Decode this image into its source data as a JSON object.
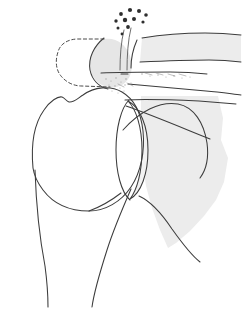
{
  "figure": {
    "caption": "",
    "width": 242,
    "height": 315,
    "background_color": "#ffffff"
  },
  "palette": {
    "outline": "#3c3c3c",
    "outline_light": "#555555",
    "shade_fill": "#ececec",
    "shade_fill_light": "#f2f2f2",
    "shade_fill_mid": "#e6e6e6",
    "dot_fill": "#2e2e2e",
    "stipple_fill": "#6e6e6e",
    "dashed_stroke": "#4a4a4a",
    "page_white": "#ffffff"
  },
  "structures": [
    {
      "id": "humeral-head",
      "label": "Humeral head",
      "kind": "outline",
      "fill": "#ffffff",
      "path": "M 33 168 C 31 146 34 124 44 110 C 50 101 58 96 62 97 C 65 98 66 101 69 102 C 73 103 77 99 83 95 C 94 87 110 85 122 92 C 134 99 141 113 143 131 C 145 151 141 172 131 187 C 121 202 105 211 89 211 C 66 211 52 202 43 190 C 37 182 34 175 33 168 Z"
    },
    {
      "id": "humeral-shaft-medial",
      "label": "Humeral shaft medial border",
      "kind": "line",
      "path": "M 35 170 C 36 200 40 240 45 266 C 47 281 48 295 48 307"
    },
    {
      "id": "humeral-shaft-lateral",
      "label": "Humeral shaft lateral border",
      "kind": "line",
      "path": "M 131 189 C 124 205 114 228 107 250 C 100 272 94 292 92 307"
    },
    {
      "id": "humeral-neck",
      "label": "Surgical neck of humerus",
      "kind": "line",
      "path": "M 89 211 C 100 207 112 200 121 193"
    },
    {
      "id": "glenoid-rim",
      "label": "Glenoid rim",
      "kind": "outline",
      "fill": "#f2f2f2",
      "path": "M 128 101 C 140 107 148 126 148 150 C 148 174 141 193 130 199 C 137 190 142 172 142 150 C 142 127 136 109 128 101 Z"
    },
    {
      "id": "glenoid-fossa-line",
      "label": "Glenoid fossa line",
      "kind": "line",
      "path": "M 129 100 C 121 108 116 128 116 150 C 116 172 121 192 130 200"
    },
    {
      "id": "scapula-body",
      "label": "Scapula body",
      "kind": "shape",
      "fill": "#ececec",
      "path": "M 141 96 L 218 96 L 223 118 L 221 140 L 228 158 L 224 182 L 216 200 L 204 216 L 190 231 L 176 243 L 168 248 L 160 230 L 152 208 L 146 186 L 142 160 L 141 130 Z"
    },
    {
      "id": "scapula-lateral-border",
      "label": "Scapula lateral border",
      "kind": "line",
      "path": "M 139 196 C 150 201 162 214 172 229 C 182 243 191 255 200 262"
    },
    {
      "id": "scapula-spine-upper",
      "label": "Scapular spine upper line",
      "kind": "line",
      "path": "M 125 100 C 146 99 176 100 199 101 C 213 102 225 103 236 104"
    },
    {
      "id": "scapula-spine-lower",
      "label": "Scapular spine lower line",
      "kind": "line",
      "path": "M 128 84 C 152 86 182 89 206 91 C 220 92 232 94 241 95"
    },
    {
      "id": "coracoid-arc",
      "label": "Coracoid / supraspinatus arc",
      "kind": "line",
      "path": "M 123 130 C 140 111 160 101 178 104 C 194 107 204 123 207 143 C 209 158 206 170 200 178"
    },
    {
      "id": "subscapular-line",
      "label": "Subscapular oblique line",
      "kind": "line",
      "path": "M 126 106 C 152 115 185 129 210 139"
    },
    {
      "id": "acromion-body",
      "label": "Acromion process",
      "kind": "shape",
      "fill": "#e6e6e6",
      "path": "M 104 39 C 116 37 126 44 130 56 C 134 68 131 80 122 85 C 113 90 100 87 94 78 C 87 68 89 48 104 39 Z"
    },
    {
      "id": "acromion-anterior-edge",
      "label": "Acromion anterior edge",
      "kind": "line",
      "path": "M 104 38 C 94 46 88 58 90 70 C 92 80 99 87 108 89"
    },
    {
      "id": "acromion-undersurface",
      "label": "Acromion undersurface line",
      "kind": "line",
      "path": "M 101 73 C 121 72 148 72 170 72 C 186 72 198 73 207 74"
    },
    {
      "id": "acromion-resection-outline",
      "label": "Resected acromion dashed outline",
      "kind": "dashed",
      "path": "M 104 39 L 78 39 C 68 39 60 44 58 52 C 55 61 56 70 61 76 C 66 82 73 86 82 86 L 110 87"
    },
    {
      "id": "clavicle-upper",
      "label": "Clavicle upper border",
      "kind": "line",
      "path": "M 142 38 C 160 35 185 33 205 33 C 220 33 232 34 241 35"
    },
    {
      "id": "clavicle-lower",
      "label": "Clavicle lower border",
      "kind": "line",
      "path": "M 140 62 C 162 61 188 60 209 60 C 223 60 233 61 241 62"
    },
    {
      "id": "clavicle-body",
      "label": "Clavicle body",
      "kind": "shape",
      "fill": "#ececec",
      "path": "M 142 38 C 160 35 185 33 205 33 L 241 35 L 241 62 L 209 60 C 188 60 162 61 140 62 Z"
    },
    {
      "id": "acromioclavicular-gap",
      "label": "Acromioclavicular joint gap",
      "kind": "line",
      "path": "M 137 40 C 133 49 131 59 131 68"
    },
    {
      "id": "coracoacromial-stem",
      "label": "Coracoacromial stem",
      "kind": "line",
      "path": "M 131 28 C 128 40 127 56 127 70"
    },
    {
      "id": "coracoacromial-stem-2",
      "label": "Coracoacromial stem medial",
      "kind": "line",
      "path": "M 124 30 C 121 42 120 56 120 70"
    },
    {
      "id": "deltoid-attachment",
      "label": "Deltoid attachment marker",
      "kind": "line",
      "path": "M 121 74 L 128 74"
    }
  ],
  "dot_cluster": {
    "label": "Calcific deposits cluster",
    "fill": "#2e2e2e",
    "dots": [
      {
        "cx": 121,
        "cy": 14,
        "r": 1.9
      },
      {
        "cx": 130,
        "cy": 10,
        "r": 2.1
      },
      {
        "cx": 139,
        "cy": 11,
        "r": 2.0
      },
      {
        "cx": 146,
        "cy": 15,
        "r": 1.8
      },
      {
        "cx": 116,
        "cy": 21,
        "r": 1.7
      },
      {
        "cx": 125,
        "cy": 20,
        "r": 2.2
      },
      {
        "cx": 134,
        "cy": 19,
        "r": 2.0
      },
      {
        "cx": 143,
        "cy": 22,
        "r": 1.6
      },
      {
        "cx": 118,
        "cy": 28,
        "r": 1.5
      },
      {
        "cx": 128,
        "cy": 27,
        "r": 1.9
      },
      {
        "cx": 122,
        "cy": 34,
        "r": 1.4
      }
    ]
  },
  "stipple_field": {
    "label": "Bone texture stipple under acromion",
    "fill": "#6e6e6e",
    "dots": [
      {
        "cx": 106,
        "cy": 79,
        "r": 0.7
      },
      {
        "cx": 111,
        "cy": 81,
        "r": 0.6
      },
      {
        "cx": 116,
        "cy": 78,
        "r": 0.7
      },
      {
        "cx": 121,
        "cy": 82,
        "r": 0.6
      },
      {
        "cx": 126,
        "cy": 79,
        "r": 0.8
      },
      {
        "cx": 109,
        "cy": 85,
        "r": 0.6
      },
      {
        "cx": 115,
        "cy": 86,
        "r": 0.7
      },
      {
        "cx": 120,
        "cy": 88,
        "r": 0.6
      },
      {
        "cx": 125,
        "cy": 85,
        "r": 0.7
      },
      {
        "cx": 131,
        "cy": 83,
        "r": 0.6
      },
      {
        "cx": 112,
        "cy": 91,
        "r": 0.6
      },
      {
        "cx": 118,
        "cy": 93,
        "r": 0.5
      },
      {
        "cx": 124,
        "cy": 91,
        "r": 0.6
      },
      {
        "cx": 142,
        "cy": 74,
        "r": 0.8
      },
      {
        "cx": 150,
        "cy": 76,
        "r": 0.6
      },
      {
        "cx": 158,
        "cy": 75,
        "r": 0.7
      },
      {
        "cx": 166,
        "cy": 77,
        "r": 0.6
      },
      {
        "cx": 174,
        "cy": 76,
        "r": 0.7
      },
      {
        "cx": 182,
        "cy": 78,
        "r": 0.6
      },
      {
        "cx": 190,
        "cy": 77,
        "r": 0.6
      }
    ]
  },
  "hatch_marks": {
    "label": "Fine hatching on acromion undersurface",
    "stroke": "#8a8a8a",
    "lines": [
      {
        "x1": 145,
        "y1": 73,
        "x2": 152,
        "y2": 75
      },
      {
        "x1": 156,
        "y1": 73,
        "x2": 163,
        "y2": 75
      },
      {
        "x1": 168,
        "y1": 74,
        "x2": 175,
        "y2": 76
      },
      {
        "x1": 179,
        "y1": 74,
        "x2": 186,
        "y2": 76
      },
      {
        "x1": 118,
        "y1": 84,
        "x2": 124,
        "y2": 87
      },
      {
        "x1": 127,
        "y1": 83,
        "x2": 133,
        "y2": 86
      }
    ]
  }
}
